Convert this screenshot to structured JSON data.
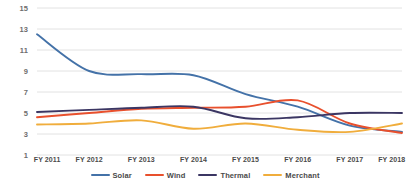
{
  "chart_data": {
    "type": "line",
    "title": "",
    "subtitle": "",
    "xlabel": "",
    "ylabel": "",
    "categories": [
      "FY 2011",
      "FY 2012",
      "FY 2013",
      "FY 2014",
      "FY 2015",
      "FY 2016",
      "FY 2017",
      "FY 2018"
    ],
    "ylim": [
      1,
      15
    ],
    "yticks": [
      1,
      3,
      5,
      7,
      9,
      11,
      13,
      15
    ],
    "ytick_labels": [
      "1",
      "3",
      "5",
      "7",
      "9",
      "11",
      "13",
      "15"
    ],
    "grid": "horizontal",
    "legend_position": "bottom-center",
    "smoothed": true,
    "markers": false,
    "series": [
      {
        "name": "Solar",
        "color": "#4472a8",
        "values": [
          12.5,
          9.0,
          8.7,
          8.6,
          6.8,
          5.6,
          3.8,
          3.2
        ]
      },
      {
        "name": "Wind",
        "color": "#e8502d",
        "values": [
          4.6,
          5.0,
          5.4,
          5.5,
          5.6,
          6.2,
          4.0,
          3.1
        ]
      },
      {
        "name": "Thermal",
        "color": "#3b3663",
        "values": [
          5.1,
          5.3,
          5.5,
          5.6,
          4.5,
          4.6,
          5.0,
          5.0
        ]
      },
      {
        "name": "Merchant",
        "color": "#f0ad3c",
        "values": [
          3.9,
          4.0,
          4.3,
          3.5,
          4.0,
          3.4,
          3.2,
          4.0
        ]
      }
    ]
  },
  "style": {
    "background": "#ffffff",
    "gridline_color": "#e2e2e2",
    "axis_label_color": "#4a4a4a",
    "ytick_color": "#6d6d6d"
  }
}
